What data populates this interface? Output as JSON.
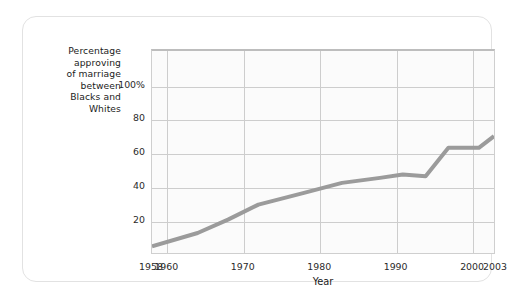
{
  "figure": {
    "y_axis_caption_lines": [
      "Percentage",
      "approving",
      "of marriage",
      "between",
      "Blacks and",
      "Whites"
    ],
    "x_axis_title": "Year",
    "line_color": "#9b9b9b",
    "grid_color": "#cdcdcd",
    "plot_background": "#fbfbfb",
    "card_border_color": "#e2e2e2"
  },
  "chart_data": {
    "type": "line",
    "title": "",
    "xlabel": "Year",
    "ylabel": "Percentage approving of marriage between Blacks and Whites",
    "xlim": [
      1958,
      2003
    ],
    "ylim": [
      0,
      121
    ],
    "grid": true,
    "legend": null,
    "ytick_labels": [
      "100%",
      "80",
      "60",
      "40",
      "20"
    ],
    "ytick_values": [
      100,
      80,
      60,
      40,
      20
    ],
    "xtick_labels": [
      "1958",
      "1960",
      "1970",
      "1980",
      "1990",
      "2000",
      "2003"
    ],
    "xtick_values": [
      1958,
      1960,
      1970,
      1980,
      1990,
      2000,
      2003
    ],
    "xgrid_values": [
      1960,
      1970,
      1980,
      1990,
      2000
    ],
    "series": [
      {
        "name": "Percentage approving",
        "x": [
          1958,
          1964,
          1968,
          1972,
          1978,
          1983,
          1988,
          1991,
          1994,
          1997,
          2001,
          2003
        ],
        "values": [
          4,
          12,
          20,
          29,
          36,
          42,
          45,
          47,
          46,
          63,
          63,
          70
        ]
      }
    ]
  }
}
